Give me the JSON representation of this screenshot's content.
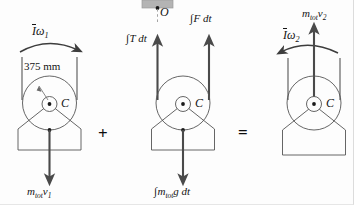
{
  "figure": {
    "equation_operators": {
      "plus": "+",
      "equals": "="
    },
    "panels": [
      {
        "id": "initial-momentum",
        "role": "initial momentum diagram",
        "labels": {
          "angular_momentum": {
            "bar_symbol": "I",
            "omega": "ω",
            "subscript": "1"
          },
          "dimension": "375 mm",
          "center_point": "C",
          "linear_momentum": {
            "m": "m",
            "m_sub": "tot",
            "v": "v",
            "v_sub": "1"
          }
        }
      },
      {
        "id": "impulse",
        "role": "external impulse diagram",
        "labels": {
          "support_point": "O",
          "tension_impulse": {
            "integral": "∫",
            "body": "T dt"
          },
          "force_impulse": {
            "integral": "∫",
            "body": "F dt"
          },
          "weight_impulse": {
            "integral": "∫",
            "m": "m",
            "m_sub": "tot",
            "rest": "g dt"
          }
        }
      },
      {
        "id": "final-momentum",
        "role": "final momentum diagram",
        "labels": {
          "angular_momentum": {
            "bar_symbol": "I",
            "omega": "ω",
            "subscript": "2"
          },
          "center_point": "C",
          "linear_momentum": {
            "m": "m",
            "m_sub": "tot",
            "v": "v",
            "v_sub": "2"
          }
        }
      }
    ],
    "colors": {
      "outline": "#4a4a4a",
      "vector": "#5a5a5a",
      "text": "#141414",
      "support_block": "#b4b4b4",
      "background": "#fdfdfd"
    }
  }
}
